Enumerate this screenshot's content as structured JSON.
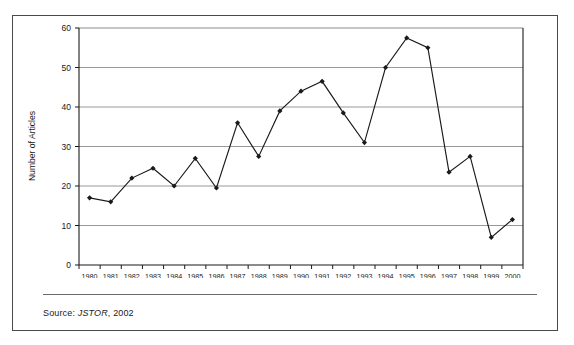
{
  "figure": {
    "source_label": "Source:",
    "source_database": "JSTOR",
    "source_year": ", 2002"
  },
  "chart_data": {
    "type": "line",
    "title": "",
    "subtitle": "",
    "xlabel": "",
    "ylabel": "Number of Articles",
    "categories": [
      "1980",
      "1981",
      "1982",
      "1983",
      "1984",
      "1985",
      "1986",
      "1987",
      "1988",
      "1989",
      "1990",
      "1991",
      "1992",
      "1993",
      "1994",
      "1995",
      "1996",
      "1997",
      "1998",
      "1999",
      "2000"
    ],
    "values": [
      17,
      16,
      22,
      24.5,
      20,
      27,
      19.5,
      36,
      27.5,
      39,
      44,
      46.5,
      38.5,
      31,
      50,
      57.5,
      55,
      23.5,
      27.5,
      7,
      11.5
    ],
    "series": [
      {
        "name": "Number of Articles",
        "values": [
          17,
          16,
          22,
          24.5,
          20,
          27,
          19.5,
          36,
          27.5,
          39,
          44,
          46.5,
          38.5,
          31,
          50,
          57.5,
          55,
          23.5,
          27.5,
          7,
          11.5
        ]
      }
    ],
    "ylim": [
      0,
      60
    ],
    "yticks": [
      0,
      10,
      20,
      30,
      40,
      50,
      60
    ],
    "ytick_labels": [
      "0",
      "10",
      "20",
      "30",
      "40",
      "50",
      "60"
    ],
    "grid": "horizontal",
    "legend": "none",
    "marker": "diamond",
    "line_color": "#1a1a1a",
    "marker_color": "#1a1a1a",
    "grid_color": "#8c8c8c",
    "axis_color": "#1a1a1a"
  }
}
